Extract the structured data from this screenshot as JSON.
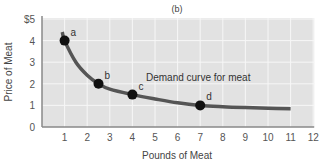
{
  "chart_data": {
    "type": "line",
    "title": "(b)",
    "xlabel": "Pounds of Meat",
    "ylabel": "Price of Meat",
    "xlim": [
      0,
      12
    ],
    "ylim": [
      0,
      5
    ],
    "x_ticks": [
      "1",
      "2",
      "3",
      "4",
      "5",
      "6",
      "7",
      "8",
      "9",
      "10",
      "11",
      "12"
    ],
    "y_ticks": [
      "0",
      "1",
      "2",
      "3",
      "4",
      "$5"
    ],
    "grid": true,
    "legend": null,
    "annotations": [
      {
        "text": "Demand curve for meat",
        "x": 4.6,
        "y": 2.3
      }
    ],
    "series": [
      {
        "name": "Demand curve for meat",
        "curve": [
          {
            "x": 0.9,
            "y": 4.4
          },
          {
            "x": 1.0,
            "y": 4.0
          },
          {
            "x": 1.5,
            "y": 3.0
          },
          {
            "x": 2.0,
            "y": 2.4
          },
          {
            "x": 2.5,
            "y": 2.0
          },
          {
            "x": 3.0,
            "y": 1.75
          },
          {
            "x": 4.0,
            "y": 1.5
          },
          {
            "x": 5.0,
            "y": 1.3
          },
          {
            "x": 6.0,
            "y": 1.12
          },
          {
            "x": 7.0,
            "y": 1.0
          },
          {
            "x": 8.0,
            "y": 0.94
          },
          {
            "x": 9.0,
            "y": 0.9
          },
          {
            "x": 10.0,
            "y": 0.87
          },
          {
            "x": 11.0,
            "y": 0.85
          }
        ],
        "points": [
          {
            "label": "a",
            "x": 1,
            "y": 4
          },
          {
            "label": "b",
            "x": 2.5,
            "y": 2
          },
          {
            "label": "c",
            "x": 4,
            "y": 1.5
          },
          {
            "label": "d",
            "x": 7,
            "y": 1
          }
        ]
      }
    ]
  },
  "colors": {
    "plot_background": "#e2e2e2",
    "gridline": "#f7f7f7",
    "axis": "#888888",
    "curve": "#555555",
    "points": "#111111"
  }
}
